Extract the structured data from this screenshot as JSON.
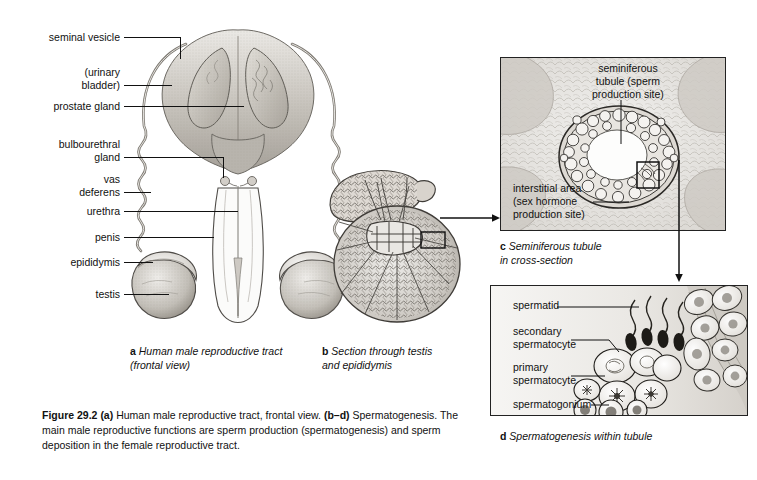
{
  "figure": {
    "number": "Figure 29.2",
    "caption_part_a": "(a) Human male reproductive tract, frontal view.",
    "caption_part_bd": "(b-d) Spermatogenesis.",
    "caption_body": "The main male reproductive functions are sperm production (spermatogenesis) and sperm deposition in the female reproductive tract."
  },
  "panel_a": {
    "caption_letter": "a",
    "caption_text": "Human male reproductive tract (frontal view)",
    "labels": [
      {
        "id": "seminal-vesicle",
        "text": "seminal vesicle"
      },
      {
        "id": "urinary-bladder",
        "line1": "(urinary",
        "line2": "bladder)"
      },
      {
        "id": "prostate-gland",
        "text": "prostate gland"
      },
      {
        "id": "bulbourethral-gland",
        "line1": "bulbourethral",
        "line2": "gland"
      },
      {
        "id": "vas-deferens",
        "line1": "vas",
        "line2": "deferens"
      },
      {
        "id": "urethra",
        "text": "urethra"
      },
      {
        "id": "penis",
        "text": "penis"
      },
      {
        "id": "epididymis",
        "text": "epididymis"
      },
      {
        "id": "testis",
        "text": "testis"
      }
    ]
  },
  "panel_b": {
    "caption_letter": "b",
    "caption_line1": "Section through testis",
    "caption_line2": "and epididymis"
  },
  "panel_c": {
    "caption_letter": "c",
    "caption_line1": "Seminiferous tubule",
    "caption_line2": "in cross-section",
    "labels": [
      {
        "id": "seminiferous-tubule",
        "line1": "seminiferous",
        "line2": "tubule (sperm",
        "line3": "production site)"
      },
      {
        "id": "interstitial-area",
        "line1": "interstitial area",
        "line2": "(sex hormone",
        "line3": "production site)"
      }
    ]
  },
  "panel_d": {
    "caption_letter": "d",
    "caption_text": "Spermatogenesis within tubule",
    "labels": [
      {
        "id": "spermatid",
        "text": "spermatid"
      },
      {
        "id": "secondary-spermatocyte",
        "line1": "secondary",
        "line2": "spermatocyte"
      },
      {
        "id": "primary-spermatocyte",
        "line1": "primary",
        "line2": "spermatocyte"
      },
      {
        "id": "spermatogonium",
        "text": "spermatogonium"
      }
    ]
  },
  "colors": {
    "ink": "#111111",
    "tissue_light": "#e8e6e2",
    "tissue_mid": "#c9c6c0",
    "tissue_dark": "#9a968f",
    "panel_bg": "#f4f4f2"
  }
}
